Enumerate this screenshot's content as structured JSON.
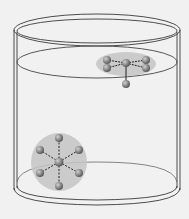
{
  "diagram": {
    "colors": {
      "background": "#f1f1f1",
      "outline": "#3a3a3a",
      "liquid_surface": "#555555",
      "halo": "#c4c4c4",
      "atom": "#8a8a8a",
      "atom_highlight": "#c8c8c8",
      "bond": "#222222"
    },
    "molecules": [
      {
        "name": "surface-molecule",
        "position": "at liquid surface",
        "center_atom": {
          "cx": 126,
          "cy": 63
        },
        "outer_atoms": [
          {
            "cx": 107,
            "cy": 60
          },
          {
            "cx": 107,
            "cy": 68
          },
          {
            "cx": 146,
            "cy": 60
          },
          {
            "cx": 146,
            "cy": 68
          },
          {
            "cx": 126,
            "cy": 84
          }
        ]
      },
      {
        "name": "bulk-molecule",
        "position": "bottom of liquid",
        "center_atom": {
          "cx": 59,
          "cy": 162
        },
        "outer_atoms": [
          {
            "cx": 59,
            "cy": 138
          },
          {
            "cx": 79,
            "cy": 150
          },
          {
            "cx": 79,
            "cy": 173
          },
          {
            "cx": 59,
            "cy": 186
          },
          {
            "cx": 40,
            "cy": 173
          },
          {
            "cx": 40,
            "cy": 150
          }
        ]
      }
    ]
  }
}
